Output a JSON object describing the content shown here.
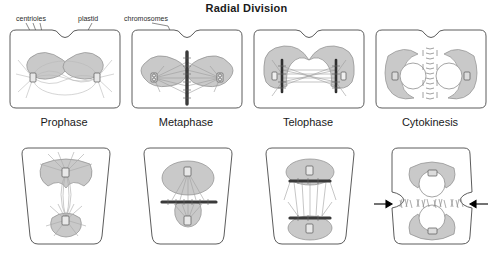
{
  "title": "Radial Division",
  "callouts": {
    "centrioles": "centrioles",
    "plastid": "plastid",
    "chromosomes": "chromosomes"
  },
  "phases": [
    {
      "label": "Prophase",
      "key": "prophase"
    },
    {
      "label": "Metaphase",
      "key": "metaphase"
    },
    {
      "label": "Telophase",
      "key": "telophase"
    },
    {
      "label": "Cytokinesis",
      "key": "cytokinesis"
    }
  ],
  "rows": [
    {
      "name": "top-row",
      "cell_shape": "rounded-rectangle-notched",
      "orientation": "horizontal"
    },
    {
      "name": "bottom-row",
      "cell_shape": "trapezoid",
      "orientation": "vertical"
    }
  ],
  "colors": {
    "outline": "#4a4a4a",
    "plastid_fill": "#c9c9c9",
    "plastid_stroke": "#8e8e8e",
    "chromosome": "#3a3a3a",
    "spindle": "#b0b0b0",
    "centriole_stroke": "#555555",
    "arrow": "#000000",
    "background": "#ffffff",
    "text": "#1a1a1a"
  },
  "structures": {
    "plastid": "plastid",
    "centriole": "centriole",
    "chromosomes": "chromosomes",
    "spindle_fibers": "spindle-fibers",
    "nucleus": "nucleus",
    "cell_plate": "cell-plate",
    "cleavage_furrow_arrow": "cleavage-furrow-arrow"
  }
}
